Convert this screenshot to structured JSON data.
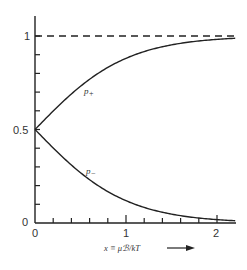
{
  "chart_data": {
    "type": "line",
    "title": "",
    "xlabel": "x ≡ μℬ/kT",
    "ylabel": "",
    "xlim": [
      0,
      2.2
    ],
    "ylim": [
      0,
      1.1
    ],
    "x_ticks": [
      0,
      0.2,
      0.4,
      0.6,
      0.8,
      1,
      1.2,
      1.4,
      1.6,
      1.8,
      2
    ],
    "x_tick_labels": [
      {
        "value": 0,
        "label": "0"
      },
      {
        "value": 1,
        "label": "1"
      },
      {
        "value": 2,
        "label": "2"
      }
    ],
    "y_ticks": [
      0,
      0.1,
      0.2,
      0.3,
      0.4,
      0.5,
      0.6,
      0.7,
      0.8,
      0.9,
      1
    ],
    "y_tick_labels": [
      {
        "value": 0,
        "label": "0"
      },
      {
        "value": 0.5,
        "label": "0.5"
      },
      {
        "value": 1,
        "label": "1"
      }
    ],
    "grid": false,
    "legend": "none (curves labeled inline)",
    "x": [
      0,
      0.2,
      0.4,
      0.6,
      0.8,
      1.0,
      1.2,
      1.4,
      1.6,
      1.8,
      2.0,
      2.2
    ],
    "series": [
      {
        "name": "p+",
        "label": "p₊",
        "style": "solid",
        "values": [
          0.5,
          0.599,
          0.69,
          0.769,
          0.832,
          0.881,
          0.917,
          0.943,
          0.961,
          0.973,
          0.982,
          0.988
        ]
      },
      {
        "name": "p-",
        "label": "p₋",
        "style": "solid",
        "values": [
          0.5,
          0.401,
          0.31,
          0.231,
          0.168,
          0.119,
          0.083,
          0.057,
          0.039,
          0.027,
          0.018,
          0.012
        ]
      },
      {
        "name": "asymptote",
        "label": "",
        "style": "dashed",
        "values": [
          1,
          1,
          1,
          1,
          1,
          1,
          1,
          1,
          1,
          1,
          1,
          1
        ]
      }
    ],
    "annotations": [
      "p₊ label near upper curve",
      "p₋ label near lower curve",
      "arrow → after x-axis label"
    ]
  },
  "labels": {
    "p_plus": "p",
    "p_plus_sub": "+",
    "p_minus": "p",
    "p_minus_sub": "−",
    "xlabel": "x ≡ μℬ/kT",
    "y1": "1",
    "y05": "0.5",
    "y0": "0",
    "x0": "0",
    "x1": "1",
    "x2": "2"
  }
}
